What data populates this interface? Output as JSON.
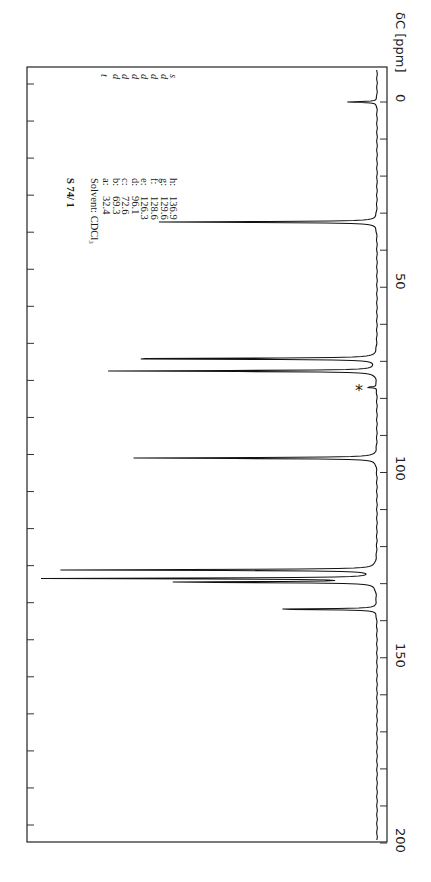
{
  "chart_data": {
    "type": "line",
    "subtitle": "Solvent: CDCl3",
    "xlabel": "δC [ppm]",
    "ylabel": "",
    "orientation": "rotated 90° clockwise (ppm axis runs top-to-bottom on right side)",
    "xlim": [
      0,
      200
    ],
    "x_ticks": [
      0,
      50,
      100,
      150,
      200
    ],
    "minor_tick_step": 10,
    "grid": false,
    "peaks": [
      {
        "label": "TMS",
        "ppm": 0.0,
        "rel_height": 0.09,
        "multiplicity": ""
      },
      {
        "label": "a",
        "ppm": 32.4,
        "rel_height": 0.66,
        "multiplicity": "t"
      },
      {
        "label": "b",
        "ppm": 69.3,
        "rel_height": 0.86,
        "multiplicity": "d"
      },
      {
        "label": "c",
        "ppm": 72.6,
        "rel_height": 0.81,
        "multiplicity": "d"
      },
      {
        "label": "solvent (*)",
        "ppm": 77.0,
        "rel_height": 0.03,
        "multiplicity": ""
      },
      {
        "label": "d",
        "ppm": 96.1,
        "rel_height": 0.74,
        "multiplicity": "d"
      },
      {
        "label": "e",
        "ppm": 126.3,
        "rel_height": 0.96,
        "multiplicity": "d"
      },
      {
        "label": "f",
        "ppm": 128.6,
        "rel_height": 1.0,
        "multiplicity": "d"
      },
      {
        "label": "g",
        "ppm": 129.6,
        "rel_height": 0.65,
        "multiplicity": "d"
      },
      {
        "label": "h",
        "ppm": 136.9,
        "rel_height": 0.33,
        "multiplicity": "s"
      }
    ],
    "annotations": [
      "*"
    ]
  },
  "sample_id": "S 74/ 1",
  "solvent": "Solvent: CDCl₃",
  "legend": [
    {
      "key": "a:",
      "value": "32.4",
      "mult": "t"
    },
    {
      "key": "b:",
      "value": "69.3",
      "mult": "d"
    },
    {
      "key": "c:",
      "value": "72.6",
      "mult": "d"
    },
    {
      "key": "d:",
      "value": "96.1",
      "mult": "d"
    },
    {
      "key": "e:",
      "value": "126.3",
      "mult": "d"
    },
    {
      "key": "f:",
      "value": "128.6",
      "mult": "d"
    },
    {
      "key": "g:",
      "value": "129.6",
      "mult": "d"
    },
    {
      "key": "h:",
      "value": "136.9",
      "mult": "s"
    }
  ],
  "axis": {
    "title": "δC [ppm]",
    "ticks": [
      "0",
      "50",
      "100",
      "150",
      "200"
    ]
  },
  "asterisk": "*"
}
